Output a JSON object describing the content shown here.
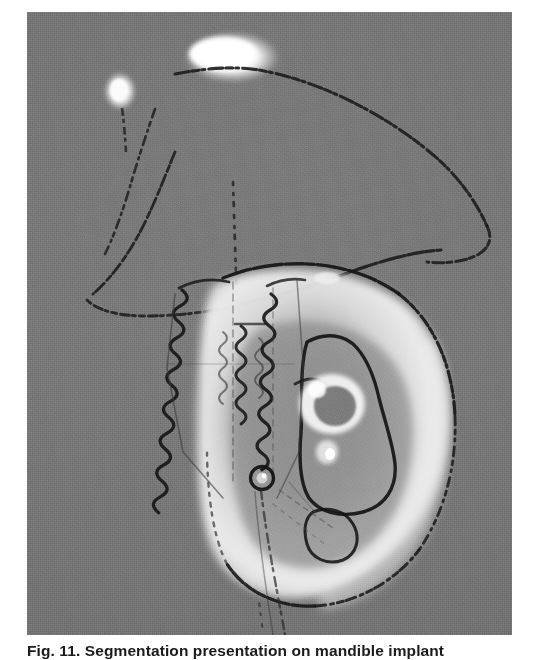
{
  "figure": {
    "label": "Fig. 11.",
    "caption_body": "Segmentation presentation on mandible implant",
    "caption_full": "Fig. 11. Segmentation presentation on mandible implant",
    "modality": "grayscale CT / radiographic slice",
    "background_gray": "#767676",
    "frame": {
      "left": 27,
      "top": 12,
      "width": 485,
      "height": 623
    }
  },
  "scan": {
    "alt": "Grayscale CT slice of a mandible with a dental implant, with dark segmentation contour lines overlaid",
    "colors": {
      "field": "#767676",
      "field_light": "#7d7d7d",
      "field_dark": "#6e6e6e",
      "bone_bright": "#f2f2f2",
      "bone_mid": "#c9c9c9",
      "bone_soft": "#a3a3a3",
      "contour_dark": "#1c1c1c",
      "contour_soft": "#3a3a3a",
      "hotspot_white": "#ffffff"
    },
    "regions": [
      {
        "name": "upper-hotspot-large",
        "type": "bright-blob",
        "cx": 205,
        "cy": 45,
        "rx": 44,
        "ry": 22
      },
      {
        "name": "upper-hotspot-small",
        "type": "bright-blob",
        "cx": 93,
        "cy": 78,
        "rx": 14,
        "ry": 17
      },
      {
        "name": "upper-bone-contour",
        "type": "segmentation-outline"
      },
      {
        "name": "mandible-body",
        "type": "bright-ring-structure"
      },
      {
        "name": "implant-threads",
        "type": "zigzag-thread-group",
        "count": 3
      },
      {
        "name": "implant-ring-marker",
        "type": "circle-marker",
        "cx": 235,
        "cy": 465,
        "r": 11
      },
      {
        "name": "inner-canal",
        "type": "dark-inner-contour"
      },
      {
        "name": "vertical-guide-line",
        "type": "dotted-line"
      }
    ]
  }
}
